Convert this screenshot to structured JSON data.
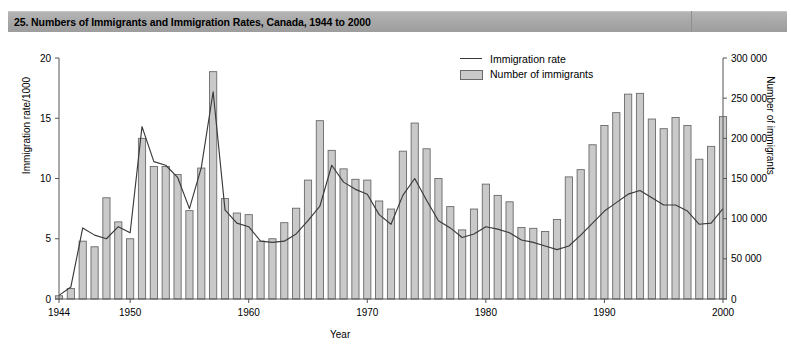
{
  "header": {
    "title": "25. Numbers of Immigrants and Immigration Rates, Canada, 1944 to 2000"
  },
  "legend": {
    "items": [
      {
        "label": "Immigration rate",
        "key": "line",
        "color": "#3a3a3a"
      },
      {
        "label": "Number of immigrants",
        "key": "bar",
        "color": "#c9c9c9"
      }
    ]
  },
  "colors": {
    "bar_fill": "#c9c9c9",
    "bar_stroke": "#6a6a6a",
    "line": "#3a3a3a",
    "axis": "#555555",
    "header_bar": "#a9a9a9",
    "background": "#ffffff"
  },
  "chart_data": {
    "type": "bar",
    "title": "25. Numbers of Immigrants and Immigration Rates, Canada, 1944 to 2000",
    "xlabel": "Year",
    "ylabel": "Immigration rate/1000",
    "y2label": "Number of immigrants",
    "grid": false,
    "legend_position": "top-center",
    "xlim": [
      1943.4,
      2000.6
    ],
    "ylim": [
      0,
      20
    ],
    "y2lim": [
      0,
      300000
    ],
    "yticks": [
      0,
      5,
      10,
      15,
      20
    ],
    "ytick_labels": [
      "0",
      "5",
      "10",
      "15",
      "20"
    ],
    "y2ticks": [
      0,
      50000,
      100000,
      150000,
      200000,
      250000,
      300000
    ],
    "y2tick_labels": [
      "0",
      "50 000",
      "100 000",
      "150 000",
      "200 000",
      "250 000",
      "300 000"
    ],
    "xticks": [
      1944,
      1950,
      1960,
      1970,
      1980,
      1990,
      2000
    ],
    "xtick_labels": [
      "1944",
      "1950",
      "1960",
      "1970",
      "1980",
      "1990",
      "2000"
    ],
    "categories": [
      1944,
      1945,
      1946,
      1947,
      1948,
      1949,
      1950,
      1951,
      1952,
      1953,
      1954,
      1955,
      1956,
      1957,
      1958,
      1959,
      1960,
      1961,
      1962,
      1963,
      1964,
      1965,
      1966,
      1967,
      1968,
      1969,
      1970,
      1971,
      1972,
      1973,
      1974,
      1975,
      1976,
      1977,
      1978,
      1979,
      1980,
      1981,
      1982,
      1983,
      1984,
      1985,
      1986,
      1987,
      1988,
      1989,
      1990,
      1991,
      1992,
      1993,
      1994,
      1995,
      1996,
      1997,
      1998,
      1999,
      2000
    ],
    "series": [
      {
        "name": "Number of immigrants",
        "axis": "right",
        "units": "persons",
        "values": [
          4000,
          13000,
          72000,
          65000,
          126000,
          96000,
          75000,
          200000,
          165000,
          165000,
          155000,
          110000,
          163000,
          283000,
          125000,
          107000,
          105000,
          72000,
          75000,
          95000,
          113000,
          148000,
          222000,
          185000,
          162000,
          149000,
          148000,
          122000,
          112000,
          184000,
          219000,
          187000,
          150000,
          115000,
          86000,
          112000,
          143000,
          129000,
          121000,
          89000,
          88000,
          84000,
          99000,
          152000,
          161000,
          192000,
          216000,
          232000,
          255000,
          256000,
          224000,
          212000,
          226000,
          216000,
          174000,
          190000,
          227000
        ]
      },
      {
        "name": "Immigration rate",
        "axis": "left",
        "units": "per 1000 population",
        "values": [
          0.3,
          1.0,
          5.9,
          5.3,
          5.0,
          6.0,
          5.5,
          14.3,
          11.4,
          11.1,
          10.1,
          7.5,
          10.9,
          17.2,
          7.4,
          6.3,
          6.0,
          4.8,
          4.7,
          4.8,
          5.4,
          6.5,
          7.7,
          11.1,
          9.7,
          9.1,
          8.7,
          7.0,
          6.2,
          8.6,
          10.0,
          8.2,
          6.5,
          5.9,
          5.1,
          5.4,
          6.0,
          5.8,
          5.5,
          4.9,
          4.7,
          4.4,
          4.1,
          4.4,
          5.3,
          6.3,
          7.3,
          8.0,
          8.7,
          9.0,
          8.4,
          7.8,
          7.8,
          7.3,
          6.2,
          6.3,
          7.5
        ]
      }
    ]
  }
}
